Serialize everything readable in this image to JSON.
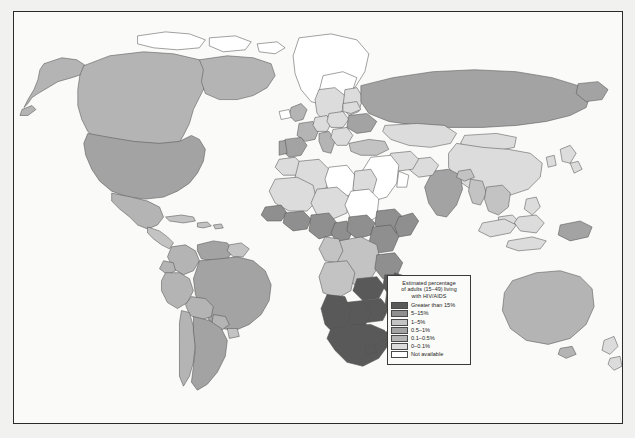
{
  "map": {
    "title": "Estimated percentage of adults (15-49) living with HIV/AIDS",
    "projection": "world",
    "frame_color": "#2a2a2a",
    "ocean_color": "#fafaf8",
    "country_border_color": "#555555"
  },
  "legend": {
    "title_line1": "Estimated percentage",
    "title_line2": "of adults (15–49) living",
    "title_line3": "with HIV/AIDS",
    "entries": [
      {
        "label": "Greater than 15%",
        "color": "#595959"
      },
      {
        "label": "5–15%",
        "color": "#8f8f8f"
      },
      {
        "label": "1–5%",
        "color": "#c3c3c3"
      },
      {
        "label": "0.5–1%",
        "color": "#a3a3a3"
      },
      {
        "label": "0.1–0.5%",
        "color": "#b4b4b4"
      },
      {
        "label": "0–0.1%",
        "color": "#dcdcdc"
      },
      {
        "label": "Not available",
        "color": "#ffffff"
      }
    ]
  },
  "chart_data": {
    "type": "choropleth",
    "legend_position": "bottom-right",
    "classes": [
      "Greater than 15%",
      "5-15%",
      "1-5%",
      "0.5-1%",
      "0.1-0.5%",
      "0-0.1%",
      "Not available"
    ],
    "regions": [
      {
        "name": "Canada",
        "class": "0.1-0.5%"
      },
      {
        "name": "United States",
        "class": "0.5-1%"
      },
      {
        "name": "Mexico",
        "class": "0.1-0.5%"
      },
      {
        "name": "Greenland",
        "class": "Not available"
      },
      {
        "name": "Brazil",
        "class": "0.5-1%"
      },
      {
        "name": "Argentina",
        "class": "0.5-1%"
      },
      {
        "name": "Colombia",
        "class": "0.1-0.5%"
      },
      {
        "name": "Peru",
        "class": "0.1-0.5%"
      },
      {
        "name": "Bolivia",
        "class": "0.1-0.5%"
      },
      {
        "name": "Venezuela",
        "class": "0.5-1%"
      },
      {
        "name": "Chile",
        "class": "0.1-0.5%"
      },
      {
        "name": "Guyana",
        "class": "1-5%"
      },
      {
        "name": "Haiti",
        "class": "1-5%"
      },
      {
        "name": "Spain",
        "class": "0.5-1%"
      },
      {
        "name": "Portugal",
        "class": "0.5-1%"
      },
      {
        "name": "France",
        "class": "0.1-0.5%"
      },
      {
        "name": "Italy",
        "class": "0.1-0.5%"
      },
      {
        "name": "Germany",
        "class": "0-0.1%"
      },
      {
        "name": "United Kingdom",
        "class": "0.1-0.5%"
      },
      {
        "name": "Ukraine",
        "class": "0.5-1%"
      },
      {
        "name": "Russia",
        "class": "0.5-1%"
      },
      {
        "name": "China",
        "class": "0-0.1%"
      },
      {
        "name": "Mongolia",
        "class": "0-0.1%"
      },
      {
        "name": "India",
        "class": "0.5-1%"
      },
      {
        "name": "Thailand",
        "class": "1-5%"
      },
      {
        "name": "Myanmar",
        "class": "1-5%"
      },
      {
        "name": "Cambodia",
        "class": "1-5%"
      },
      {
        "name": "Indonesia",
        "class": "0-0.1%"
      },
      {
        "name": "Australia",
        "class": "0.1-0.5%"
      },
      {
        "name": "Papua New Guinea",
        "class": "0.5-1%"
      },
      {
        "name": "South Africa",
        "class": "Greater than 15%"
      },
      {
        "name": "Botswana",
        "class": "Greater than 15%"
      },
      {
        "name": "Zimbabwe",
        "class": "Greater than 15%"
      },
      {
        "name": "Zambia",
        "class": "Greater than 15%"
      },
      {
        "name": "Namibia",
        "class": "Greater than 15%"
      },
      {
        "name": "Lesotho",
        "class": "Greater than 15%"
      },
      {
        "name": "Swaziland",
        "class": "Greater than 15%"
      },
      {
        "name": "Malawi",
        "class": "Greater than 15%"
      },
      {
        "name": "Mozambique",
        "class": "Greater than 15%"
      },
      {
        "name": "Kenya",
        "class": "5-15%"
      },
      {
        "name": "Tanzania",
        "class": "5-15%"
      },
      {
        "name": "Uganda",
        "class": "5-15%"
      },
      {
        "name": "Central African Republic",
        "class": "5-15%"
      },
      {
        "name": "Cameroon",
        "class": "5-15%"
      },
      {
        "name": "Ivory Coast",
        "class": "5-15%"
      },
      {
        "name": "Nigeria",
        "class": "5-15%"
      },
      {
        "name": "Ethiopia",
        "class": "5-15%"
      },
      {
        "name": "Congo DR",
        "class": "1-5%"
      },
      {
        "name": "Angola",
        "class": "1-5%"
      },
      {
        "name": "Madagascar",
        "class": "0.1-0.5%"
      },
      {
        "name": "Egypt",
        "class": "0-0.1%"
      },
      {
        "name": "Algeria",
        "class": "0-0.1%"
      },
      {
        "name": "Libya",
        "class": "Not available"
      },
      {
        "name": "Saudi Arabia",
        "class": "Not available"
      },
      {
        "name": "Iran",
        "class": "0-0.1%"
      },
      {
        "name": "Iraq",
        "class": "Not available"
      }
    ]
  }
}
